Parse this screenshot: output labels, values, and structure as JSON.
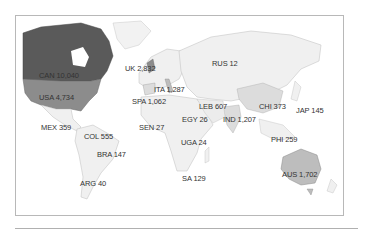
{
  "map": {
    "type": "choropleth world map",
    "colors": {
      "ocean": "#ffffff",
      "land_default": "#f0f0f0",
      "border": "#bdbdbd",
      "high": "#5a5a5a",
      "mid": "#8c8c8c",
      "low_mid": "#bdbdbd",
      "low": "#dcdcdc"
    },
    "labels": [
      {
        "code": "CAN",
        "value": "10,040",
        "x": 38,
        "y": 70
      },
      {
        "code": "USA",
        "value": "4,734",
        "x": 38,
        "y": 92
      },
      {
        "code": "MEX",
        "value": "359",
        "x": 38,
        "y": 122
      },
      {
        "code": "COL",
        "value": "555",
        "x": 83,
        "y": 131
      },
      {
        "code": "BRA",
        "value": "147",
        "x": 96,
        "y": 149
      },
      {
        "code": "ARG",
        "value": "40",
        "x": 79,
        "y": 178
      },
      {
        "code": "UK",
        "value": "2,832",
        "x": 124,
        "y": 63
      },
      {
        "code": "ITA",
        "value": "1,287",
        "x": 153,
        "y": 84
      },
      {
        "code": "SPA",
        "value": "1,062",
        "x": 131,
        "y": 96
      },
      {
        "code": "SEN",
        "value": "27",
        "x": 138,
        "y": 122
      },
      {
        "code": "EGY",
        "value": "26",
        "x": 181,
        "y": 114
      },
      {
        "code": "LEB",
        "value": "607",
        "x": 198,
        "y": 101
      },
      {
        "code": "UGA",
        "value": "24",
        "x": 180,
        "y": 137
      },
      {
        "code": "SA",
        "value": "129",
        "x": 181,
        "y": 173
      },
      {
        "code": "RUS",
        "value": "12",
        "x": 211,
        "y": 58
      },
      {
        "code": "IND",
        "value": "1,207",
        "x": 222,
        "y": 114
      },
      {
        "code": "CHI",
        "value": "373",
        "x": 258,
        "y": 101
      },
      {
        "code": "JAP",
        "value": "145",
        "x": 295,
        "y": 105
      },
      {
        "code": "PHI",
        "value": "259",
        "x": 270,
        "y": 134
      },
      {
        "code": "AUS",
        "value": "1,702",
        "x": 281,
        "y": 169
      }
    ]
  }
}
